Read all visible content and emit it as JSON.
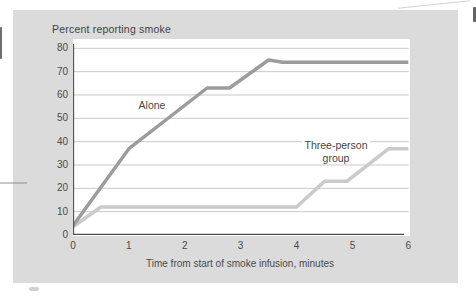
{
  "figure": {
    "panel_bg": "#dbdbdb",
    "plot_bg": "#ffffff",
    "axis_color": "#4f4f4f",
    "grid_color": "#c3c3c3",
    "text_color": "#454545"
  },
  "chart_data": {
    "type": "line",
    "title": "Percent reporting smoke",
    "xlabel": "Time from start of smoke infusion, minutes",
    "ylabel": "Percent reporting smoke",
    "xlim": [
      0,
      6
    ],
    "ylim": [
      0,
      80
    ],
    "x_ticks": [
      0,
      1,
      2,
      3,
      4,
      5,
      6
    ],
    "y_ticks": [
      0,
      10,
      20,
      30,
      40,
      50,
      60,
      70,
      80
    ],
    "grid": "horizontal-only",
    "legend": "inline-series-labels",
    "series": [
      {
        "name": "Alone",
        "color": "#9c9c9c",
        "stroke_width": 3.4,
        "label_lines": [
          "Alone"
        ],
        "points": [
          [
            0,
            4
          ],
          [
            1,
            37
          ],
          [
            2.4,
            63
          ],
          [
            2.8,
            63
          ],
          [
            3.5,
            75
          ],
          [
            3.75,
            74
          ],
          [
            6,
            74
          ]
        ]
      },
      {
        "name": "Three-person group",
        "color": "#cacaca",
        "stroke_width": 3.6,
        "label_lines": [
          "Three-person",
          "group"
        ],
        "points": [
          [
            0,
            3.5
          ],
          [
            0.5,
            12
          ],
          [
            4,
            12
          ],
          [
            4.5,
            23
          ],
          [
            4.9,
            23
          ],
          [
            5.65,
            37
          ],
          [
            6,
            37
          ]
        ]
      }
    ]
  }
}
